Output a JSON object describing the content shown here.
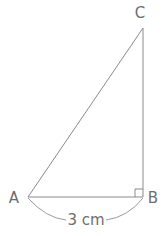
{
  "diagram": {
    "type": "right-triangle",
    "background_color": "#ffffff",
    "stroke_color": "#8a8a8a",
    "text_color": "#6e6e6e",
    "vertices": [
      {
        "name": "A",
        "label": "A",
        "x": 28,
        "y": 197,
        "label_x": 14,
        "label_y": 203
      },
      {
        "name": "B",
        "label": "B",
        "x": 143,
        "y": 197,
        "label_x": 150,
        "label_y": 203
      },
      {
        "name": "C",
        "label": "C",
        "x": 143,
        "y": 28,
        "label_x": 136,
        "label_y": 18
      }
    ],
    "sides": [
      {
        "name": "base-AB",
        "from": "A",
        "to": "B"
      },
      {
        "name": "vertical-BC",
        "from": "B",
        "to": "C"
      },
      {
        "name": "hypotenuse-AC",
        "from": "A",
        "to": "C"
      }
    ],
    "right_angle": {
      "at": "B",
      "size": 8
    },
    "dimension": {
      "name": "base-measurement",
      "text": "3 cm",
      "value": 3,
      "unit": "cm",
      "applies_to": "base-AB",
      "text_x": 84,
      "text_y": 223
    }
  }
}
